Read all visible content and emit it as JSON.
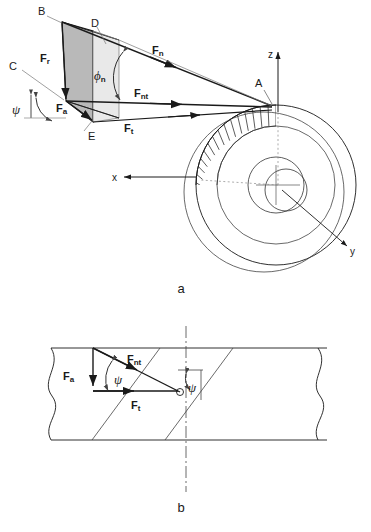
{
  "figure": {
    "panels": [
      {
        "id": "a",
        "caption": "a",
        "description": "Helical gear force components in three dimensions at contact point A",
        "points": [
          {
            "name": "B",
            "label": "B"
          },
          {
            "name": "C",
            "label": "C"
          },
          {
            "name": "D",
            "label": "D"
          },
          {
            "name": "E",
            "label": "E"
          },
          {
            "name": "A",
            "label": "A"
          }
        ],
        "forces": [
          {
            "name": "radial",
            "symbol": "F",
            "subscript": "r"
          },
          {
            "name": "axial",
            "symbol": "F",
            "subscript": "a"
          },
          {
            "name": "normal",
            "symbol": "F",
            "subscript": "n"
          },
          {
            "name": "normal-tangential",
            "symbol": "F",
            "subscript": "nt"
          },
          {
            "name": "tangential",
            "symbol": "F",
            "subscript": "t"
          }
        ],
        "angles": [
          {
            "name": "normal-pressure-angle",
            "symbol": "ϕ",
            "subscript": "n"
          },
          {
            "name": "helix-angle",
            "symbol": "ψ",
            "subscript": ""
          }
        ],
        "axes": [
          {
            "name": "z",
            "label": "z"
          },
          {
            "name": "x",
            "label": "x"
          },
          {
            "name": "y",
            "label": "y"
          }
        ]
      },
      {
        "id": "b",
        "caption": "b",
        "description": "Unrolled pitch cylinder view showing helix angle and in-plane force triangle",
        "forces": [
          {
            "name": "axial",
            "symbol": "F",
            "subscript": "a"
          },
          {
            "name": "normal-tangential",
            "symbol": "F",
            "subscript": "nt"
          },
          {
            "name": "tangential",
            "symbol": "F",
            "subscript": "t"
          }
        ],
        "angles": [
          {
            "name": "helix-angle-left",
            "symbol": "ψ"
          },
          {
            "name": "helix-angle-right",
            "symbol": "ψ"
          }
        ]
      }
    ],
    "colors": {
      "line": "#1a1a1a",
      "thin": "#555555",
      "shade": "#b9b9b9",
      "shade_light": "#e2e2e2",
      "background": "#ffffff"
    }
  }
}
